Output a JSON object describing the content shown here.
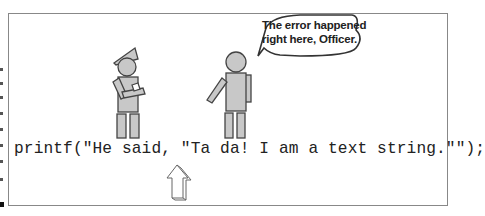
{
  "figure": {
    "speech_bubble": {
      "lines": [
        "The error happened",
        "right here, Officer."
      ]
    },
    "code_line": "printf(\"He said, \"Ta da! I am a text string.\"\");",
    "characters": [
      "officer",
      "witness"
    ],
    "pointer": "up-arrow"
  }
}
